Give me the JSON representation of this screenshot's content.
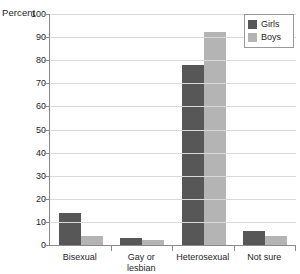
{
  "chart_data": {
    "type": "bar",
    "title": "",
    "subtitle": "",
    "xlabel": "",
    "ylabel": "Percent",
    "ylim": [
      0,
      100
    ],
    "ytick_step": 10,
    "yticks": [
      "100",
      "90",
      "80",
      "70",
      "60",
      "50",
      "40",
      "30",
      "20",
      "10",
      "0"
    ],
    "grid": true,
    "legend_position": "top-right",
    "categories": [
      "Bisexual",
      "Gay or\nlesbian",
      "Heterosexual",
      "Not sure"
    ],
    "series": [
      {
        "name": "Girls",
        "color": "#575757",
        "values": [
          14,
          3,
          78,
          6
        ]
      },
      {
        "name": "Boys",
        "color": "#b4b4b4",
        "values": [
          4,
          2,
          92,
          4
        ]
      }
    ]
  },
  "legend": {
    "entries": [
      {
        "label": "Girls"
      },
      {
        "label": "Boys"
      }
    ]
  },
  "axis": {
    "y_title": "Percent"
  },
  "colors": {
    "girls": "#575757",
    "boys": "#b4b4b4",
    "grid": "#d9d9d9",
    "axis": "#8a8a8a",
    "background": "#ffffff"
  }
}
